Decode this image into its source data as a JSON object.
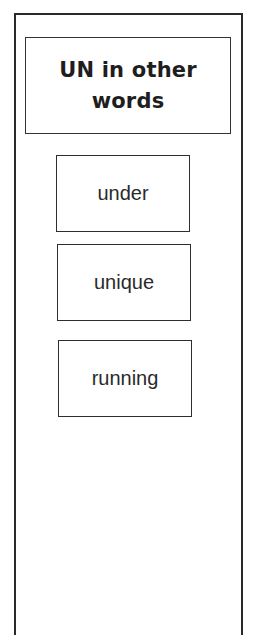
{
  "title": "UN in other words",
  "title_lines": [
    "UN in other",
    "words"
  ],
  "words": [
    {
      "label": "under"
    },
    {
      "label": "unique"
    },
    {
      "label": "running"
    }
  ]
}
